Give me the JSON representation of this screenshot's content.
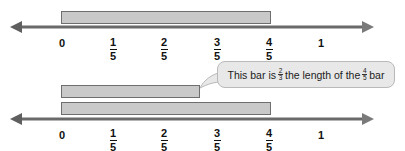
{
  "diagram": {
    "colors": {
      "bar_fill": "#c9c9c9",
      "bar_border": "#6e6e6e",
      "axis": "#6a6a6a",
      "callout_fill": "#e8e8e8",
      "callout_border": "#b9b9b9",
      "text": "#111111"
    },
    "number_line_top": {
      "ticks": [
        {
          "label": "0"
        },
        {
          "num": "1",
          "den": "5"
        },
        {
          "num": "2",
          "den": "5"
        },
        {
          "num": "3",
          "den": "5"
        },
        {
          "num": "4",
          "den": "5"
        },
        {
          "label": "1"
        }
      ],
      "bars": [
        {
          "name": "four-fifths-bar",
          "start": "0",
          "end": "4/5"
        }
      ]
    },
    "number_line_bottom": {
      "ticks": [
        {
          "label": "0"
        },
        {
          "num": "1",
          "den": "5"
        },
        {
          "num": "2",
          "den": "5"
        },
        {
          "num": "3",
          "den": "5"
        },
        {
          "num": "4",
          "den": "5"
        },
        {
          "label": "1"
        }
      ],
      "bars": [
        {
          "name": "two-thirds-of-four-fifths-bar",
          "start": "0",
          "end": "8/15"
        },
        {
          "name": "four-fifths-bar",
          "start": "0",
          "end": "4/5"
        }
      ]
    },
    "callout": {
      "text_before": "This bar is",
      "frac1": {
        "num": "2",
        "den": "3"
      },
      "text_middle": "the length of the",
      "frac2": {
        "num": "4",
        "den": "5"
      },
      "text_after": "bar"
    }
  }
}
